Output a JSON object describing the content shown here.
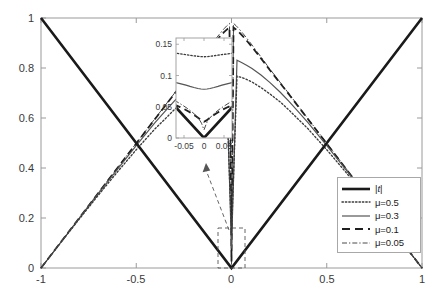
{
  "chart_data": {
    "type": "line",
    "title": "",
    "xlabel": "",
    "ylabel": "",
    "xlim": [
      -1,
      1
    ],
    "ylim": [
      0,
      1
    ],
    "xticks": [
      "-1",
      "-0.5",
      "0",
      "0.5",
      "1"
    ],
    "xtick_values": [
      -1,
      -0.5,
      0,
      0.5,
      1
    ],
    "yticks": [
      "0",
      "0.2",
      "0.4",
      "0.6",
      "0.8",
      "1"
    ],
    "ytick_values": [
      0,
      0.2,
      0.4,
      0.6,
      0.8,
      1
    ],
    "grid": false,
    "legend_position": "lower-right",
    "series": [
      {
        "name": "|t|",
        "style": "solid-thick",
        "color": "#1a1a1a",
        "width": 2.6,
        "description": "absolute value function y = |t|",
        "points_x": [
          -1,
          -0.75,
          -0.5,
          -0.25,
          -0.1,
          -0.05,
          -0.02,
          0,
          0.02,
          0.05,
          0.1,
          0.25,
          0.5,
          0.75,
          1
        ],
        "points_y": [
          1,
          0.75,
          0.5,
          0.25,
          0.1,
          0.05,
          0.02,
          0,
          0.02,
          0.05,
          0.1,
          0.25,
          0.5,
          0.75,
          1
        ]
      },
      {
        "name": "μ=0.5",
        "mu": 0.5,
        "style": "dotted",
        "color": "#3a3a3a",
        "width": 1.3,
        "minimum": 0.13,
        "description": "smoothed |t| with mu = 0.5, minimum approx 0.13 at t = 0",
        "points_x": [
          -1,
          -0.8,
          -0.6,
          -0.4,
          -0.3,
          -0.2,
          -0.1,
          -0.05,
          0,
          0.05,
          0.1,
          0.2,
          0.3,
          0.4,
          0.6,
          0.8,
          1
        ],
        "points_y": [
          1.0,
          0.802,
          0.608,
          0.424,
          0.339,
          0.264,
          0.2,
          0.176,
          0.13,
          0.176,
          0.2,
          0.264,
          0.339,
          0.424,
          0.608,
          0.802,
          1.0
        ]
      },
      {
        "name": "μ=0.3",
        "mu": 0.3,
        "style": "solid-thin",
        "color": "#555555",
        "width": 1.2,
        "minimum": 0.078,
        "description": "smoothed |t| with mu = 0.3, minimum approx 0.078 at t = 0",
        "points_x": [
          -1,
          -0.8,
          -0.6,
          -0.4,
          -0.3,
          -0.2,
          -0.1,
          -0.05,
          0,
          0.05,
          0.1,
          0.2,
          0.3,
          0.4,
          0.6,
          0.8,
          1
        ],
        "points_y": [
          1.0,
          0.801,
          0.604,
          0.414,
          0.324,
          0.241,
          0.172,
          0.148,
          0.078,
          0.148,
          0.172,
          0.241,
          0.324,
          0.414,
          0.604,
          0.801,
          1.0
        ]
      },
      {
        "name": "μ=0.1",
        "mu": 0.1,
        "style": "dashed",
        "color": "#1f1f1f",
        "width": 1.8,
        "minimum": 0.026,
        "description": "smoothed |t| with mu = 0.1, minimum approx 0.026 at t = 0",
        "points_x": [
          -1,
          -0.6,
          -0.3,
          -0.15,
          -0.08,
          -0.04,
          0,
          0.04,
          0.08,
          0.15,
          0.3,
          0.6,
          1
        ],
        "points_y": [
          1.0,
          0.6,
          0.3,
          0.152,
          0.086,
          0.052,
          0.026,
          0.052,
          0.086,
          0.152,
          0.3,
          0.6,
          1.0
        ]
      },
      {
        "name": "μ=0.05",
        "mu": 0.05,
        "style": "dash-dot",
        "color": "#4a4a4a",
        "width": 1.0,
        "minimum": 0.013,
        "description": "smoothed |t| with mu = 0.05, minimum approx 0.013 at t = 0",
        "points_x": [
          -1,
          -0.6,
          -0.3,
          -0.15,
          -0.08,
          -0.04,
          0,
          0.04,
          0.08,
          0.15,
          0.3,
          0.6,
          1
        ],
        "points_y": [
          1.0,
          0.6,
          0.3,
          0.151,
          0.082,
          0.045,
          0.013,
          0.045,
          0.082,
          0.151,
          0.3,
          0.6,
          1.0
        ]
      }
    ],
    "inset": {
      "xlim": [
        -0.07,
        0.07
      ],
      "ylim": [
        0,
        0.16
      ],
      "xticks": [
        "-0.05",
        "0",
        "0.05"
      ],
      "xtick_values": [
        -0.05,
        0,
        0.05
      ],
      "yticks": [
        "0",
        "0.05",
        "0.1",
        "0.15"
      ],
      "ytick_values": [
        0,
        0.05,
        0.1,
        0.15
      ],
      "annotation": "magnified view near t = 0",
      "zoom_box_x": [
        -0.07,
        0.07
      ],
      "zoom_box_y": [
        0,
        0.16
      ]
    }
  },
  "legend": {
    "items": [
      {
        "label_html": "|t|",
        "label": "|t|"
      },
      {
        "label_html": "μ=0.5",
        "label": "μ=0.5"
      },
      {
        "label_html": "μ=0.3",
        "label": "μ=0.3"
      },
      {
        "label_html": "μ=0.1",
        "label": "μ=0.1"
      },
      {
        "label_html": "μ=0.05",
        "label": "μ=0.05"
      }
    ]
  },
  "colors": {
    "axis": "#9a9a9a",
    "text": "#3a3a3a",
    "curve_main": "#1a1a1a",
    "background": "#ffffff",
    "annotation": "#555555"
  }
}
